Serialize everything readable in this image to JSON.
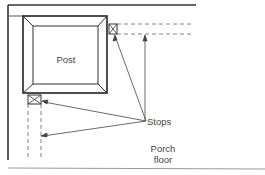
{
  "diagram": {
    "labels": {
      "post": "Post",
      "stops": "Stops",
      "porch_line1": "Porch",
      "porch_line2": "floor"
    },
    "colors": {
      "line": "#333333",
      "dashed": "#666666",
      "background": "#ffffff"
    }
  }
}
